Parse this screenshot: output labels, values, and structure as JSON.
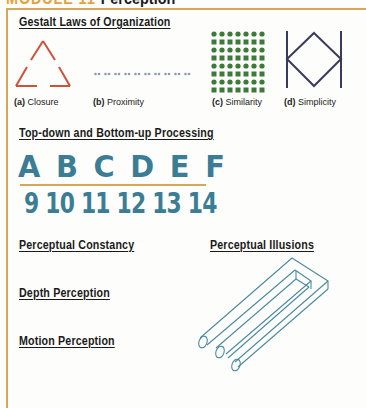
{
  "header": {
    "module_label": "MODULE 11",
    "title": "Perception"
  },
  "sections": {
    "gestalt": {
      "heading": "Gestalt Laws of Organization",
      "figures": [
        {
          "tag": "(a)",
          "label": "Closure"
        },
        {
          "tag": "(b)",
          "label": "Proximity"
        },
        {
          "tag": "(c)",
          "label": "Similarity"
        },
        {
          "tag": "(d)",
          "label": "Simplicity"
        }
      ]
    },
    "processing": {
      "heading": "Top-down and Bottom-up Processing",
      "letters": "A B C D E F",
      "numbers": "9 10 11 12 13 14"
    },
    "constancy": {
      "heading": "Perceptual Constancy"
    },
    "illusions": {
      "heading": "Perceptual Illusions"
    },
    "depth": {
      "heading": "Depth Perception"
    },
    "motion": {
      "heading": "Motion Perception"
    }
  },
  "colors": {
    "accent_orange": "#d8a657",
    "closure_red": "#d0503a",
    "proximity_blue": "#8a9cb4",
    "similarity_green": "#3d7a3a",
    "simplicity_navy": "#3a3a5c",
    "stencil_teal": "#3b7d94",
    "illusion_teal": "#4a8aa0"
  }
}
